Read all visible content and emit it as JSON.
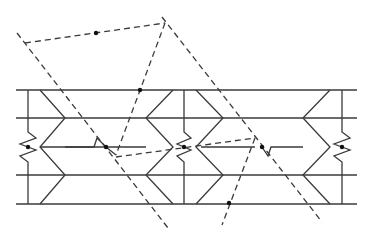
{
  "diagram": {
    "title": "",
    "colors": {
      "background": "#ffffff",
      "line": "#3a3a3a",
      "node": "#111111"
    },
    "horizontal_rails": [
      {
        "y": 90,
        "x1": 16,
        "x2": 357
      },
      {
        "y": 118,
        "x1": 16,
        "x2": 357
      },
      {
        "y": 175,
        "x1": 16,
        "x2": 357
      },
      {
        "y": 204,
        "x1": 16,
        "x2": 357
      }
    ],
    "middle_rail": {
      "points": "40,147 94,147 97,138 106,147 116,155",
      "points_right": "201,147 255,147",
      "points_right2": "262,147 268,156 271,147 303,147",
      "points_center_left": "65,147 146,147"
    },
    "elements": [
      {
        "name": "left",
        "post_x": 28,
        "chevron": "40,90 65,118 40,147 65,175 40,204",
        "spring": "28,90 28,132 36,138 20,144 28,147 36,150 20,156 28,162 28,204"
      },
      {
        "name": "center",
        "post_x": 184,
        "chevron_left": "173,90 146,118 173,147 146,175 173,204",
        "chevron_right": "196,90 223,118 196,147 223,175 196,204",
        "spring": "184,90 184,132 191,138 177,144 184,147 191,150 177,156 184,162 184,204"
      },
      {
        "name": "right",
        "post_x": 342,
        "chevron": "330,90 303,118 330,147 303,175 330,204",
        "spring": "342,90 342,132 350,138 334,144 342,147 350,150 334,156 342,162 342,204"
      }
    ],
    "dashed_lines": [
      {
        "name": "top-link",
        "x1": 25,
        "y1": 43,
        "x2": 165,
        "y2": 23
      },
      {
        "name": "left-diagonal",
        "x1": 17,
        "y1": 33,
        "x2": 168,
        "y2": 228
      },
      {
        "name": "right-diagonal",
        "x1": 162,
        "y1": 17,
        "x2": 322,
        "y2": 222
      },
      {
        "name": "apex-to-lower-left",
        "x1": 165,
        "y1": 23,
        "x2": 116,
        "y2": 155
      },
      {
        "name": "cross-link",
        "x1": 116,
        "y1": 157,
        "x2": 255,
        "y2": 138
      },
      {
        "name": "right-apex-down",
        "x1": 255,
        "y1": 138,
        "x2": 222,
        "y2": 225
      }
    ],
    "nodes": [
      {
        "name": "top-link-mid",
        "cx": 96,
        "cy": 33
      },
      {
        "name": "apex-rail-cross",
        "cx": 140,
        "cy": 90
      },
      {
        "name": "left-spring-node",
        "cx": 28,
        "cy": 147
      },
      {
        "name": "left-kink-node",
        "cx": 106,
        "cy": 147
      },
      {
        "name": "center-spring-node",
        "cx": 184,
        "cy": 147
      },
      {
        "name": "right-kink-node",
        "cx": 262,
        "cy": 147
      },
      {
        "name": "right-spring-node",
        "cx": 342,
        "cy": 147
      },
      {
        "name": "bottom-rail-node",
        "cx": 229,
        "cy": 203
      }
    ]
  }
}
